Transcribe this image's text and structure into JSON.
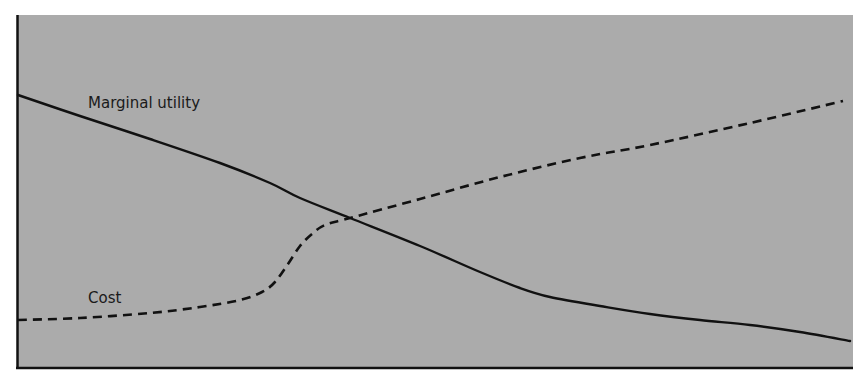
{
  "chart_data": {
    "type": "line",
    "title": "",
    "xlabel": "",
    "ylabel": "",
    "grid": false,
    "legend": "inline labels",
    "background_color": "#ababab",
    "axis_color": "#111111",
    "series": [
      {
        "name": "Marginal utility",
        "style": "solid",
        "color": "#111111",
        "label_position": {
          "x": 88,
          "y": 108
        },
        "points": [
          [
            18,
            95
          ],
          [
            80,
            116
          ],
          [
            150,
            139
          ],
          [
            220,
            163
          ],
          [
            270,
            183
          ],
          [
            300,
            198
          ],
          [
            350,
            218
          ],
          [
            420,
            246
          ],
          [
            480,
            272
          ],
          [
            520,
            288
          ],
          [
            550,
            297
          ],
          [
            600,
            306
          ],
          [
            650,
            314
          ],
          [
            700,
            320
          ],
          [
            750,
            325
          ],
          [
            800,
            332
          ],
          [
            850,
            341
          ]
        ]
      },
      {
        "name": "Cost",
        "style": "dashed",
        "color": "#111111",
        "label_position": {
          "x": 88,
          "y": 303
        },
        "points": [
          [
            18,
            320
          ],
          [
            80,
            318
          ],
          [
            150,
            313
          ],
          [
            200,
            307
          ],
          [
            240,
            300
          ],
          [
            262,
            292
          ],
          [
            275,
            282
          ],
          [
            288,
            264
          ],
          [
            300,
            246
          ],
          [
            312,
            234
          ],
          [
            325,
            225
          ],
          [
            350,
            218
          ],
          [
            420,
            199
          ],
          [
            500,
            177
          ],
          [
            580,
            158
          ],
          [
            650,
            145
          ],
          [
            750,
            123
          ],
          [
            843,
            101
          ]
        ]
      }
    ],
    "annotations": [
      {
        "text": "Marginal utility",
        "near_series": "Marginal utility"
      },
      {
        "text": "Cost",
        "near_series": "Cost"
      }
    ],
    "intersection": {
      "x": 350,
      "y": 218
    }
  },
  "labels": {
    "marginal_utility": "Marginal utility",
    "cost": "Cost"
  }
}
